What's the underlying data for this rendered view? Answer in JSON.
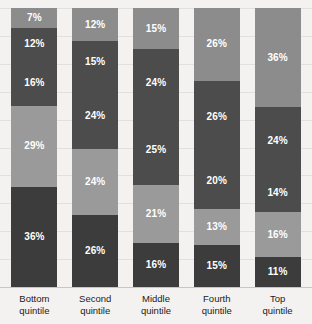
{
  "chart_data": {
    "type": "bar",
    "subtype": "stacked-bar-100",
    "title": "",
    "subtitle": "",
    "xlabel": "",
    "ylabel": "",
    "ylim": [
      0,
      100
    ],
    "grid": true,
    "legend": "none",
    "orientation": "vertical",
    "stack_order": "top-to-bottom",
    "categories": [
      "Bottom quintile",
      "Second quintile",
      "Middle quintile",
      "Fourth quintile",
      "Top quintile"
    ],
    "category_lines": [
      [
        "Bottom",
        "quintile"
      ],
      [
        "Second",
        "quintile"
      ],
      [
        "Middle",
        "quintile"
      ],
      [
        "Fourth",
        "quintile"
      ],
      [
        "Top",
        "quintile"
      ]
    ],
    "series": [
      {
        "name": "Top fifth",
        "values": [
          7,
          12,
          15,
          26,
          36
        ],
        "color": "#8c8c8c"
      },
      {
        "name": "Fourth fifth",
        "values": [
          12,
          15,
          24,
          26,
          24
        ],
        "color": "#4c4c4c"
      },
      {
        "name": "Middle fifth",
        "values": [
          16,
          24,
          25,
          20,
          14
        ],
        "color": "#4c4c4c"
      },
      {
        "name": "Second fifth",
        "values": [
          29,
          24,
          21,
          13,
          16
        ],
        "color": "#9a9a9a"
      },
      {
        "name": "Bottom fifth",
        "values": [
          36,
          26,
          16,
          15,
          11
        ],
        "color": "#3c3c3c"
      }
    ],
    "columns": [
      {
        "category": "Bottom quintile",
        "segments": [
          {
            "label": "7%",
            "value": 7,
            "color": "#8c8c8c"
          },
          {
            "label": "12%",
            "value": 12,
            "color": "#4c4c4c"
          },
          {
            "label": "16%",
            "value": 16,
            "color": "#4c4c4c"
          },
          {
            "label": "29%",
            "value": 29,
            "color": "#9a9a9a"
          },
          {
            "label": "36%",
            "value": 36,
            "color": "#3c3c3c"
          }
        ]
      },
      {
        "category": "Second quintile",
        "segments": [
          {
            "label": "12%",
            "value": 12,
            "color": "#8c8c8c"
          },
          {
            "label": "15%",
            "value": 15,
            "color": "#4c4c4c"
          },
          {
            "label": "24%",
            "value": 24,
            "color": "#4c4c4c"
          },
          {
            "label": "24%",
            "value": 24,
            "color": "#9a9a9a"
          },
          {
            "label": "26%",
            "value": 26,
            "color": "#3c3c3c"
          }
        ]
      },
      {
        "category": "Middle quintile",
        "segments": [
          {
            "label": "15%",
            "value": 15,
            "color": "#8c8c8c"
          },
          {
            "label": "24%",
            "value": 24,
            "color": "#4c4c4c"
          },
          {
            "label": "25%",
            "value": 25,
            "color": "#4c4c4c"
          },
          {
            "label": "21%",
            "value": 21,
            "color": "#9a9a9a"
          },
          {
            "label": "16%",
            "value": 16,
            "color": "#3c3c3c"
          }
        ]
      },
      {
        "category": "Fourth quintile",
        "segments": [
          {
            "label": "26%",
            "value": 26,
            "color": "#8c8c8c"
          },
          {
            "label": "26%",
            "value": 26,
            "color": "#4c4c4c"
          },
          {
            "label": "20%",
            "value": 20,
            "color": "#4c4c4c"
          },
          {
            "label": "13%",
            "value": 13,
            "color": "#9a9a9a"
          },
          {
            "label": "15%",
            "value": 15,
            "color": "#3c3c3c"
          }
        ]
      },
      {
        "category": "Top quintile",
        "segments": [
          {
            "label": "36%",
            "value": 36,
            "color": "#8c8c8c"
          },
          {
            "label": "24%",
            "value": 24,
            "color": "#4c4c4c"
          },
          {
            "label": "14%",
            "value": 14,
            "color": "#4c4c4c"
          },
          {
            "label": "16%",
            "value": 16,
            "color": "#9a9a9a"
          },
          {
            "label": "11%",
            "value": 11,
            "color": "#3c3c3c"
          }
        ]
      }
    ],
    "gridline_count": 10,
    "colors": {
      "background": "#f3f2f0",
      "gridline": "#e2e0dc",
      "axis": "#c9c6c0",
      "label_text": "#1a1a1a",
      "segment_text": "#ffffff"
    }
  }
}
